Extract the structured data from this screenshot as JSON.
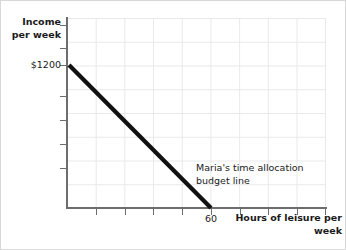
{
  "chart_data": {
    "type": "line",
    "title": "",
    "xlabel": "Hours of leisure per week",
    "ylabel": "Income per week",
    "xlim": [
      0,
      90
    ],
    "ylim": [
      0,
      1600
    ],
    "grid": true,
    "legend_position": "none",
    "series": [
      {
        "name": "Maria's time allocation budget line",
        "points": [
          {
            "x": 0,
            "y": 1200
          },
          {
            "x": 60,
            "y": 0
          }
        ],
        "color": "#000000",
        "line_width": "thick"
      }
    ],
    "annotations": [
      {
        "text": "Maria's time allocation\nbudget line",
        "x": 60,
        "y": 240
      }
    ]
  },
  "axes": {
    "y_title": "Income per\nweek",
    "x_title": "Hours of leisure\nper week",
    "y_labeled_tick": "$1200",
    "x_labeled_tick": "60",
    "y_tick_offsets": [
      24,
      47,
      64,
      95,
      119,
      143,
      167
    ],
    "x_tick_offsets": [
      95,
      124,
      152,
      181,
      210,
      239,
      267,
      296,
      324
    ],
    "axis_color": "#6d6d6d",
    "grid_color": "#e9e9e9"
  },
  "annotation": {
    "label": "Maria's time allocation\nbudget line"
  },
  "frame": {
    "border_color": "#d8d8d8",
    "background": "#ffffff"
  }
}
